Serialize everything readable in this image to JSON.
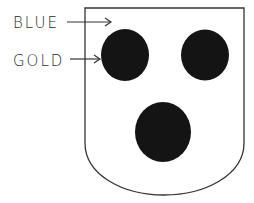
{
  "diagram": {
    "type": "heraldic-shield",
    "labels": [
      {
        "text": "BLUE",
        "points_to": "field"
      },
      {
        "text": "GOLD",
        "points_to": "roundel"
      }
    ],
    "shield": {
      "field_tincture": "BLUE",
      "stroke": "#333333",
      "fill": "#ffffff"
    },
    "charges": [
      {
        "name": "roundel-top-left",
        "tincture": "GOLD",
        "fill": "#141414"
      },
      {
        "name": "roundel-top-right",
        "tincture": "GOLD",
        "fill": "#141414"
      },
      {
        "name": "roundel-bottom",
        "tincture": "GOLD",
        "fill": "#141414"
      }
    ]
  }
}
